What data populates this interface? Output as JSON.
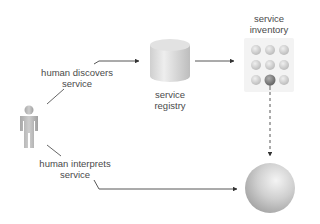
{
  "diagram": {
    "nodes": {
      "human": {
        "icon": "person-icon"
      },
      "registry": {
        "label_line1": "service",
        "label_line2": "registry",
        "icon": "database-cylinder-icon"
      },
      "inventory": {
        "label_line1": "service",
        "label_line2": "inventory",
        "icon": "service-grid-icon",
        "grid_rows": 3,
        "grid_cols": 3,
        "highlighted_cell": "row3-col2"
      },
      "service": {
        "icon": "sphere-icon"
      }
    },
    "edges": {
      "discovers": {
        "label_line1": "human discovers",
        "label_line2": "service",
        "from": "human",
        "to": "registry",
        "style": "solid"
      },
      "registry_to_inventory": {
        "from": "registry",
        "to": "inventory",
        "style": "solid"
      },
      "inventory_to_service": {
        "from": "inventory",
        "to": "service",
        "style": "dashed"
      },
      "interprets": {
        "label_line1": "human interprets",
        "label_line2": "service",
        "from": "human",
        "to": "service",
        "style": "solid"
      }
    }
  },
  "colors": {
    "line": "#444444",
    "shape_gray": "#c8c8c8",
    "highlight_gray": "#7a7a7a"
  }
}
